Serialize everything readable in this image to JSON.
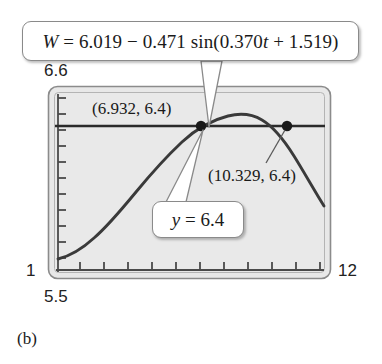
{
  "figure": {
    "caption": "(b)",
    "equation_callout": "W = 6.019 − 0.471 sin(0.370t + 1.519)",
    "yline_callout": "y = 6.4"
  },
  "axes": {
    "y_max_label": "6.6",
    "y_min_label": "1",
    "x_min_label": "5.5",
    "x_max_label": "12"
  },
  "annotations": {
    "point_1_label": "(6.932, 6.4)",
    "point_2_label": "(10.329, 6.4)"
  },
  "colors": {
    "plot_background": "#e8e8e8",
    "frame": "#8a8a8a",
    "curve": "#3a3a3a",
    "horizontal_line": "#2b2b2b",
    "callout_border": "#8a8a8a",
    "text": "#1a1a1a"
  },
  "chart_data": {
    "type": "line",
    "title": "",
    "xlabel": "t",
    "ylabel": "W",
    "xlim": [
      1,
      12
    ],
    "ylim": [
      5.5,
      6.6
    ],
    "grid": false,
    "legend": "none",
    "x_tick_labels": [
      "1",
      "12"
    ],
    "y_tick_labels": [
      "5.5",
      "6.6"
    ],
    "series": [
      {
        "name": "W = 6.019 - 0.471 sin(0.370t + 1.519)",
        "formula": "W = 6.019 - 0.471*sin(0.370*t + 1.519)",
        "x": [
          1.0,
          1.5,
          2.0,
          2.5,
          3.0,
          3.5,
          4.0,
          4.5,
          5.0,
          5.5,
          6.0,
          6.5,
          7.0,
          7.5,
          8.0,
          8.5,
          9.0,
          9.5,
          10.0,
          10.5,
          11.0,
          11.5,
          12.0
        ],
        "y": [
          5.551,
          5.562,
          5.583,
          5.614,
          5.654,
          5.702,
          5.757,
          5.818,
          5.882,
          5.949,
          6.016,
          6.082,
          6.145,
          6.204,
          6.257,
          6.302,
          6.34,
          6.368,
          6.386,
          6.395,
          6.393,
          6.381,
          6.359
        ]
      },
      {
        "name": "y = 6.4",
        "type": "horizontal-line",
        "value": 6.4
      }
    ],
    "points": [
      {
        "label": "(6.932, 6.4)",
        "x": 6.932,
        "y": 6.4
      },
      {
        "label": "(10.329, 6.4)",
        "x": 10.329,
        "y": 6.4
      }
    ]
  }
}
